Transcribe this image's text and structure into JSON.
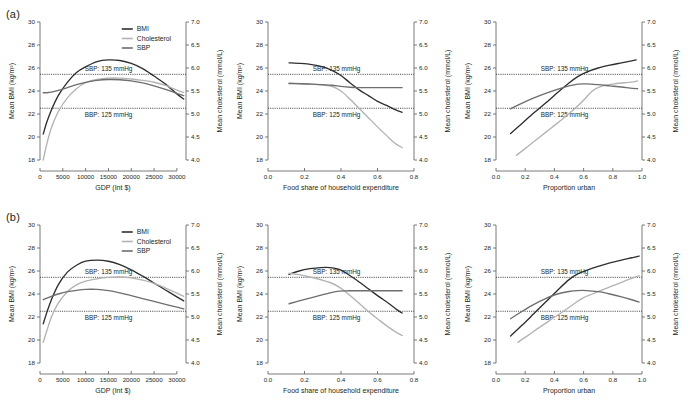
{
  "figure": {
    "panel_tags": [
      "(a)",
      "(b)"
    ],
    "legend": {
      "items": [
        {
          "label": "BMI",
          "color": "#2f2f2f"
        },
        {
          "label": "Cholesterol",
          "color": "#b3b3b3"
        },
        {
          "label": "SBP",
          "color": "#6e6e6e"
        }
      ]
    },
    "reference_lines": [
      {
        "label": "SBP: 135 mmHg",
        "bmi_value": 25.45
      },
      {
        "label": "BBP: 125 mmHg",
        "bmi_value": 22.5
      }
    ],
    "left_axis": {
      "title": "Mean BMI (kg/m²)",
      "min": 18,
      "max": 30,
      "ticks": [
        18,
        20,
        22,
        24,
        26,
        28,
        30
      ],
      "ticklabels": [
        "18",
        "20",
        "22",
        "24",
        "26",
        "28",
        "30"
      ]
    },
    "right_axis": {
      "title": "Mean cholesterol (mmol/L)",
      "min": 4.0,
      "max": 7.0,
      "ticks": [
        4.0,
        4.5,
        5.0,
        5.5,
        6.0,
        6.5,
        7.0
      ],
      "ticklabels": [
        "4.0",
        "4.5",
        "5.0",
        "5.5",
        "6.0",
        "6.5",
        "7.0"
      ]
    }
  },
  "chart_data": [
    {
      "type": "line",
      "panel": "a",
      "column": 0,
      "title": "",
      "xlabel": "GDP (Int $)",
      "ylabel": "Mean BMI (kg/m²)",
      "y2label": "Mean cholesterol (mmol/L)",
      "xlim": [
        0,
        32000
      ],
      "ylim": [
        18,
        30
      ],
      "y2lim": [
        4.0,
        7.0
      ],
      "xticks": [
        0,
        5000,
        10000,
        15000,
        20000,
        25000,
        30000
      ],
      "xticklabels": [
        "0",
        "5000",
        "10000",
        "15000",
        "20000",
        "25000",
        "30000"
      ],
      "grid": false,
      "legend_position": "top-right",
      "series": [
        {
          "name": "BMI",
          "color": "#2f2f2f",
          "axis": "left",
          "x": [
            700,
            1500,
            2500,
            4000,
            6000,
            8000,
            10000,
            12500,
            15000,
            17500,
            20000,
            22500,
            25000,
            27500,
            30000,
            31500
          ],
          "values": [
            20.25,
            21.3,
            22.35,
            23.6,
            24.75,
            25.6,
            26.1,
            26.55,
            26.7,
            26.65,
            26.4,
            25.95,
            25.3,
            24.6,
            23.75,
            23.3
          ]
        },
        {
          "name": "Cholesterol",
          "color": "#b3b3b3",
          "axis": "right",
          "x": [
            700,
            1500,
            2500,
            4000,
            6000,
            8000,
            10000,
            12500,
            15000,
            17500,
            20000,
            22500,
            25000,
            27500,
            30000,
            31500
          ],
          "values": [
            4.0,
            4.35,
            4.7,
            5.05,
            5.35,
            5.55,
            5.68,
            5.75,
            5.78,
            5.78,
            5.76,
            5.73,
            5.69,
            5.62,
            5.52,
            5.47
          ]
        },
        {
          "name": "SBP",
          "color": "#6e6e6e",
          "axis": "left",
          "x": [
            700,
            1500,
            2500,
            4000,
            6000,
            8000,
            10000,
            12500,
            15000,
            17500,
            20000,
            22500,
            25000,
            27500,
            30000,
            31500
          ],
          "values": [
            23.85,
            23.85,
            23.9,
            24.05,
            24.3,
            24.55,
            24.75,
            24.93,
            25.0,
            24.98,
            24.88,
            24.7,
            24.45,
            24.15,
            23.8,
            23.6
          ]
        }
      ]
    },
    {
      "type": "line",
      "panel": "a",
      "column": 1,
      "title": "",
      "xlabel": "Food share of household expenditure",
      "ylabel": "Mean BMI (kg/m²)",
      "y2label": "Mean cholesterol (mmol/L)",
      "xlim": [
        0.0,
        0.8
      ],
      "ylim": [
        18,
        30
      ],
      "y2lim": [
        4.0,
        7.0
      ],
      "xticks": [
        0.0,
        0.2,
        0.4,
        0.6,
        0.8
      ],
      "xticklabels": [
        "0.0",
        "0.2",
        "0.4",
        "0.6",
        "0.8"
      ],
      "grid": false,
      "legend_position": "none",
      "series": [
        {
          "name": "BMI",
          "color": "#2f2f2f",
          "axis": "left",
          "x": [
            0.115,
            0.18,
            0.24,
            0.3,
            0.35,
            0.4,
            0.45,
            0.5,
            0.55,
            0.6,
            0.65,
            0.7,
            0.735
          ],
          "values": [
            26.45,
            26.4,
            26.3,
            26.1,
            25.8,
            25.35,
            24.7,
            24.1,
            23.6,
            23.1,
            22.75,
            22.35,
            22.15
          ]
        },
        {
          "name": "Cholesterol",
          "color": "#b3b3b3",
          "axis": "right",
          "x": [
            0.115,
            0.18,
            0.24,
            0.3,
            0.35,
            0.4,
            0.45,
            0.5,
            0.55,
            0.6,
            0.65,
            0.7,
            0.735
          ],
          "values": [
            5.67,
            5.66,
            5.65,
            5.63,
            5.6,
            5.5,
            5.32,
            5.12,
            4.92,
            4.72,
            4.53,
            4.35,
            4.27
          ]
        },
        {
          "name": "SBP",
          "color": "#6e6e6e",
          "axis": "left",
          "x": [
            0.115,
            0.18,
            0.24,
            0.3,
            0.35,
            0.4,
            0.45,
            0.5,
            0.55,
            0.6,
            0.65,
            0.7,
            0.735
          ],
          "values": [
            24.65,
            24.63,
            24.6,
            24.55,
            24.5,
            24.4,
            24.33,
            24.3,
            24.3,
            24.3,
            24.3,
            24.3,
            24.3
          ]
        }
      ]
    },
    {
      "type": "line",
      "panel": "a",
      "column": 2,
      "title": "",
      "xlabel": "Proportion urban",
      "ylabel": "Mean BMI (kg/m²)",
      "y2label": "Mean cholesterol (mmol/L)",
      "xlim": [
        0.0,
        1.0
      ],
      "ylim": [
        18,
        30
      ],
      "y2lim": [
        4.0,
        7.0
      ],
      "xticks": [
        0.0,
        0.2,
        0.4,
        0.6,
        0.8,
        1.0
      ],
      "xticklabels": [
        "0.0",
        "0.2",
        "0.4",
        "0.6",
        "0.8",
        "1.0"
      ],
      "grid": false,
      "legend_position": "none",
      "series": [
        {
          "name": "BMI",
          "color": "#2f2f2f",
          "axis": "left",
          "x": [
            0.1,
            0.18,
            0.26,
            0.34,
            0.42,
            0.5,
            0.56,
            0.62,
            0.7,
            0.78,
            0.86,
            0.92,
            0.96
          ],
          "values": [
            20.3,
            21.2,
            22.1,
            22.95,
            23.85,
            24.7,
            25.25,
            25.65,
            26.0,
            26.25,
            26.45,
            26.6,
            26.7
          ]
        },
        {
          "name": "Cholesterol",
          "color": "#b3b3b3",
          "axis": "right",
          "x": [
            0.14,
            0.22,
            0.3,
            0.38,
            0.46,
            0.54,
            0.6,
            0.66,
            0.72,
            0.8,
            0.88,
            0.94,
            0.97
          ],
          "values": [
            4.1,
            4.3,
            4.5,
            4.7,
            4.9,
            5.12,
            5.3,
            5.5,
            5.6,
            5.65,
            5.68,
            5.7,
            5.72
          ]
        },
        {
          "name": "SBP",
          "color": "#6e6e6e",
          "axis": "left",
          "x": [
            0.1,
            0.18,
            0.26,
            0.34,
            0.42,
            0.5,
            0.56,
            0.62,
            0.7,
            0.78,
            0.86,
            0.92,
            0.97
          ],
          "values": [
            22.45,
            22.95,
            23.4,
            23.8,
            24.15,
            24.45,
            24.6,
            24.62,
            24.55,
            24.45,
            24.35,
            24.25,
            24.2
          ]
        }
      ]
    },
    {
      "type": "line",
      "panel": "b",
      "column": 0,
      "title": "",
      "xlabel": "GDP (Int $)",
      "ylabel": "Mean BMI (kg/m²)",
      "y2label": "Mean cholesterol (mmol/L)",
      "xlim": [
        0,
        32000
      ],
      "ylim": [
        18,
        30
      ],
      "y2lim": [
        4.0,
        7.0
      ],
      "xticks": [
        0,
        5000,
        10000,
        15000,
        20000,
        25000,
        30000
      ],
      "xticklabels": [
        "0",
        "5000",
        "10000",
        "15000",
        "20000",
        "25000",
        "30000"
      ],
      "grid": false,
      "legend_position": "top-right",
      "series": [
        {
          "name": "BMI",
          "color": "#2f2f2f",
          "axis": "left",
          "x": [
            700,
            1500,
            2500,
            4000,
            6000,
            8000,
            10000,
            12500,
            15000,
            17500,
            20000,
            22500,
            25000,
            27500,
            30000,
            31500
          ],
          "values": [
            21.4,
            22.4,
            23.5,
            24.8,
            25.9,
            26.5,
            26.85,
            26.95,
            26.85,
            26.55,
            26.1,
            25.55,
            24.95,
            24.35,
            23.75,
            23.4
          ]
        },
        {
          "name": "Cholesterol",
          "color": "#b3b3b3",
          "axis": "right",
          "x": [
            700,
            1500,
            2500,
            4000,
            6000,
            8000,
            10000,
            12500,
            15000,
            17500,
            20000,
            22500,
            25000,
            27500,
            30000,
            31500
          ],
          "values": [
            4.45,
            4.7,
            5.0,
            5.3,
            5.55,
            5.7,
            5.78,
            5.83,
            5.86,
            5.87,
            5.85,
            5.8,
            5.73,
            5.63,
            5.52,
            5.45
          ]
        },
        {
          "name": "SBP",
          "color": "#6e6e6e",
          "axis": "left",
          "x": [
            700,
            1500,
            2500,
            4000,
            6000,
            8000,
            10000,
            12500,
            15000,
            17500,
            20000,
            22500,
            25000,
            27500,
            30000,
            31500
          ],
          "values": [
            23.5,
            23.65,
            23.8,
            24.0,
            24.2,
            24.32,
            24.4,
            24.4,
            24.3,
            24.1,
            23.85,
            23.6,
            23.35,
            23.1,
            22.85,
            22.7
          ]
        }
      ]
    },
    {
      "type": "line",
      "panel": "b",
      "column": 1,
      "title": "",
      "xlabel": "Food share of household expenditure",
      "ylabel": "Mean BMI (kg/m²)",
      "y2label": "Mean cholesterol (mmol/L)",
      "xlim": [
        0.0,
        0.8
      ],
      "ylim": [
        18,
        30
      ],
      "y2lim": [
        4.0,
        7.0
      ],
      "xticks": [
        0.0,
        0.2,
        0.4,
        0.6,
        0.8
      ],
      "xticklabels": [
        "0.0",
        "0.2",
        "0.4",
        "0.6",
        "0.8"
      ],
      "grid": false,
      "legend_position": "none",
      "series": [
        {
          "name": "BMI",
          "color": "#2f2f2f",
          "axis": "left",
          "x": [
            0.115,
            0.17,
            0.23,
            0.29,
            0.34,
            0.39,
            0.44,
            0.49,
            0.55,
            0.61,
            0.66,
            0.71,
            0.735
          ],
          "values": [
            25.7,
            26.0,
            26.2,
            26.3,
            26.3,
            26.15,
            25.7,
            25.15,
            24.45,
            23.75,
            23.2,
            22.6,
            22.35
          ]
        },
        {
          "name": "Cholesterol",
          "color": "#b3b3b3",
          "axis": "right",
          "x": [
            0.115,
            0.17,
            0.23,
            0.29,
            0.34,
            0.39,
            0.44,
            0.49,
            0.55,
            0.61,
            0.66,
            0.71,
            0.735
          ],
          "values": [
            5.95,
            5.92,
            5.87,
            5.81,
            5.75,
            5.65,
            5.5,
            5.33,
            5.12,
            4.93,
            4.78,
            4.65,
            4.6
          ]
        },
        {
          "name": "SBP",
          "color": "#6e6e6e",
          "axis": "left",
          "x": [
            0.115,
            0.17,
            0.23,
            0.29,
            0.34,
            0.39,
            0.44,
            0.5,
            0.56,
            0.62,
            0.68,
            0.735
          ],
          "values": [
            23.15,
            23.4,
            23.65,
            23.9,
            24.1,
            24.25,
            24.28,
            24.28,
            24.28,
            24.28,
            24.28,
            24.28
          ]
        }
      ]
    },
    {
      "type": "line",
      "panel": "b",
      "column": 2,
      "title": "",
      "xlabel": "Proportion urban",
      "ylabel": "Mean BMI (kg/m²)",
      "y2label": "Mean cholesterol (mmol/L)",
      "xlim": [
        0.0,
        1.0
      ],
      "ylim": [
        18,
        30
      ],
      "y2lim": [
        4.0,
        7.0
      ],
      "xticks": [
        0.0,
        0.2,
        0.4,
        0.6,
        0.8,
        1.0
      ],
      "xticklabels": [
        "0.0",
        "0.2",
        "0.4",
        "0.6",
        "0.8",
        "1.0"
      ],
      "grid": false,
      "legend_position": "none",
      "series": [
        {
          "name": "BMI",
          "color": "#2f2f2f",
          "axis": "left",
          "x": [
            0.1,
            0.18,
            0.26,
            0.34,
            0.42,
            0.5,
            0.56,
            0.62,
            0.7,
            0.78,
            0.86,
            0.93,
            0.98
          ],
          "values": [
            20.35,
            21.3,
            22.3,
            23.3,
            24.3,
            25.25,
            25.75,
            26.05,
            26.4,
            26.7,
            26.95,
            27.15,
            27.3
          ]
        },
        {
          "name": "Cholesterol",
          "color": "#b3b3b3",
          "axis": "right",
          "x": [
            0.15,
            0.22,
            0.3,
            0.38,
            0.46,
            0.54,
            0.6,
            0.66,
            0.72,
            0.8,
            0.88,
            0.94,
            0.98
          ],
          "values": [
            4.45,
            4.6,
            4.78,
            4.95,
            5.12,
            5.3,
            5.42,
            5.5,
            5.58,
            5.68,
            5.78,
            5.85,
            5.9
          ]
        },
        {
          "name": "SBP",
          "color": "#6e6e6e",
          "axis": "left",
          "x": [
            0.1,
            0.18,
            0.26,
            0.34,
            0.42,
            0.5,
            0.56,
            0.62,
            0.7,
            0.78,
            0.86,
            0.93,
            0.98
          ],
          "values": [
            21.85,
            22.5,
            23.1,
            23.6,
            24.0,
            24.22,
            24.3,
            24.3,
            24.2,
            24.0,
            23.75,
            23.5,
            23.3
          ]
        }
      ]
    }
  ]
}
